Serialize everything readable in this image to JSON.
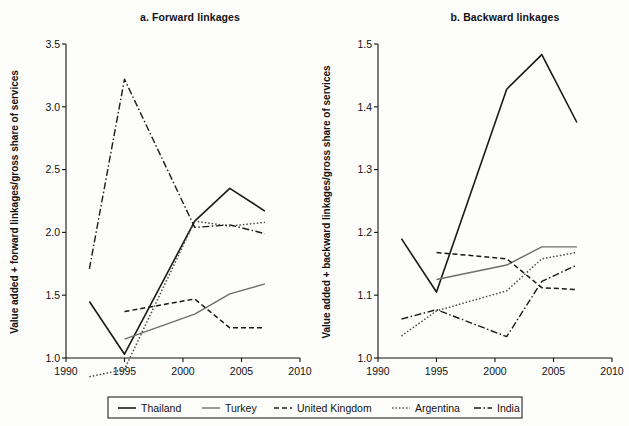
{
  "figure": {
    "background": "#fdfdfc",
    "panels": [
      {
        "id": "panel-a",
        "title": "a. Forward linkages",
        "ylabel": "Value added + forward linkages/gross share of services",
        "xlabel": "",
        "ylim": [
          1.0,
          3.5
        ],
        "xlim": [
          1990,
          2010
        ],
        "yticks": [
          "1.0",
          "1.5",
          "2.0",
          "2.5",
          "3.0",
          "3.5"
        ],
        "ytick_values": [
          1.0,
          1.5,
          2.0,
          2.5,
          3.0,
          3.5
        ],
        "xticks": [
          "1990",
          "1995",
          "2000",
          "2005",
          "2010"
        ],
        "xtick_values": [
          1990,
          1995,
          2000,
          2005,
          2010
        ]
      },
      {
        "id": "panel-b",
        "title": "b. Backward linkages",
        "ylabel": "Value added + backward linkages/gross share of services",
        "xlabel": "",
        "ylim": [
          1.0,
          1.5
        ],
        "xlim": [
          1990,
          2010
        ],
        "yticks": [
          "1.0",
          "1.1",
          "1.2",
          "1.3",
          "1.4",
          "1.5"
        ],
        "ytick_values": [
          1.0,
          1.1,
          1.2,
          1.3,
          1.4,
          1.5
        ],
        "xticks": [
          "1990",
          "1995",
          "2000",
          "2005",
          "2010"
        ],
        "xtick_values": [
          1990,
          1995,
          2000,
          2005,
          2010
        ]
      }
    ]
  },
  "legend": {
    "position": "bottom",
    "entries": [
      {
        "label": "Thailand",
        "color": "#1a1a1a",
        "dash": "none",
        "width": 1.6
      },
      {
        "label": "Turkey",
        "color": "#6e6e6e",
        "dash": "none",
        "width": 1.4
      },
      {
        "label": "United Kingdom",
        "color": "#1a1a1a",
        "dash": "5,3",
        "width": 1.5
      },
      {
        "label": "Argentina",
        "color": "#4a4a4a",
        "dash": "1.5,2",
        "width": 1.5
      },
      {
        "label": "India",
        "color": "#1a1a1a",
        "dash": "7,2.5,1.5,2.5",
        "width": 1.4
      }
    ]
  },
  "chart_data": [
    {
      "type": "line",
      "title": "a. Forward linkages",
      "xlabel": "",
      "ylabel": "Value added + forward linkages/gross share of services",
      "xlim": [
        1990,
        2010
      ],
      "ylim": [
        1.0,
        3.5
      ],
      "grid": false,
      "legend_position": "bottom",
      "series": [
        {
          "name": "Thailand",
          "x": [
            1992,
            1995,
            2001,
            2004,
            2007
          ],
          "values": [
            1.45,
            1.03,
            2.09,
            2.35,
            2.17
          ]
        },
        {
          "name": "Turkey",
          "x": [
            1995,
            2001,
            2004,
            2007
          ],
          "values": [
            1.15,
            1.35,
            1.51,
            1.59
          ]
        },
        {
          "name": "United Kingdom",
          "x": [
            1995,
            2001,
            2004,
            2007
          ],
          "values": [
            1.37,
            1.47,
            1.24,
            1.24
          ]
        },
        {
          "name": "Argentina",
          "x": [
            1992,
            1995,
            2001,
            2004,
            2007
          ],
          "values": [
            0.85,
            0.91,
            2.09,
            2.05,
            2.08
          ]
        },
        {
          "name": "India",
          "x": [
            1992,
            1995,
            2001,
            2004,
            2007
          ],
          "values": [
            1.71,
            3.22,
            2.04,
            2.06,
            1.99
          ]
        }
      ]
    },
    {
      "type": "line",
      "title": "b. Backward linkages",
      "xlabel": "",
      "ylabel": "Value added + backward linkages/gross share of services",
      "xlim": [
        1990,
        2010
      ],
      "ylim": [
        1.0,
        1.5
      ],
      "grid": false,
      "legend_position": "bottom",
      "series": [
        {
          "name": "Thailand",
          "x": [
            1992,
            1995,
            2001,
            2004,
            2007
          ],
          "values": [
            1.19,
            1.105,
            1.428,
            1.483,
            1.375
          ]
        },
        {
          "name": "Turkey",
          "x": [
            1995,
            2001,
            2004,
            2007
          ],
          "values": [
            1.125,
            1.148,
            1.177,
            1.177
          ]
        },
        {
          "name": "United Kingdom",
          "x": [
            1995,
            2001,
            2004,
            2007
          ],
          "values": [
            1.168,
            1.158,
            1.112,
            1.109
          ]
        },
        {
          "name": "Argentina",
          "x": [
            1992,
            1995,
            2001,
            2004,
            2007
          ],
          "values": [
            1.035,
            1.075,
            1.107,
            1.158,
            1.168
          ]
        },
        {
          "name": "India",
          "x": [
            1992,
            1995,
            2001,
            2004,
            2007
          ],
          "values": [
            1.062,
            1.077,
            1.034,
            1.122,
            1.148
          ]
        }
      ]
    }
  ]
}
